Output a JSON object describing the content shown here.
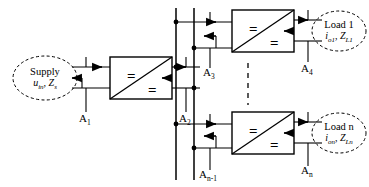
{
  "diagram": {
    "colors": {
      "line": "#000000",
      "background": "#ffffff",
      "dash": "#000000"
    },
    "converter_symbol": {
      "top_label": "=",
      "bottom_label": "="
    },
    "sources": [
      {
        "id": "supply",
        "line1": "Supply",
        "var_current": "u",
        "var_current_sub": "in",
        "var_impedance": "Z",
        "var_impedance_sub": "s"
      }
    ],
    "loads": [
      {
        "id": "load-1",
        "line1": "Load 1",
        "var_current": "i",
        "var_current_sub": "o1",
        "var_impedance": "Z",
        "var_impedance_sub": "L1"
      },
      {
        "id": "load-n",
        "line1": "Load n",
        "var_current": "i",
        "var_current_sub": "on",
        "var_impedance": "Z",
        "var_impedance_sub": "Ln"
      }
    ],
    "converters": [
      {
        "id": "converter-input",
        "eq_top": "=",
        "eq_bottom": "="
      },
      {
        "id": "converter-load-1",
        "eq_top": "=",
        "eq_bottom": "="
      },
      {
        "id": "converter-load-n",
        "eq_top": "=",
        "eq_bottom": "="
      }
    ],
    "ports": [
      {
        "id": "a1",
        "base": "A",
        "sub": "1"
      },
      {
        "id": "a2",
        "base": "A",
        "sub": "2"
      },
      {
        "id": "a3",
        "base": "A",
        "sub": "3"
      },
      {
        "id": "a4",
        "base": "A",
        "sub": "4"
      },
      {
        "id": "an1",
        "base": "A",
        "sub": "n-1"
      },
      {
        "id": "an",
        "base": "A",
        "sub": "n"
      }
    ],
    "repetition_indicator": {
      "style": "vertical-dashed",
      "meaning": "additional identical converter-load branches"
    }
  }
}
